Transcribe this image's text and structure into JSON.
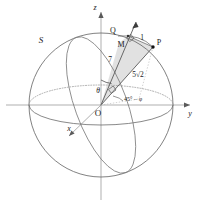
{
  "figure": {
    "type": "geometry-diagram",
    "background_color": "#ffffff",
    "line_color": "#555555",
    "label_color": "#1a1a1a",
    "shade_color": "#d8d8d8",
    "axes": {
      "z_label": "z",
      "y_label": "y",
      "x_label": "x"
    },
    "points": {
      "origin_label": "O",
      "p_label": "P",
      "q_label": "Q",
      "m_label": "M",
      "sphere_label": "S"
    },
    "measures": {
      "segment_om": "7",
      "segment_mq": "1",
      "segment_op": "5√2",
      "angle_theta": "θ",
      "angle_azimuth": "45° − φ"
    }
  }
}
